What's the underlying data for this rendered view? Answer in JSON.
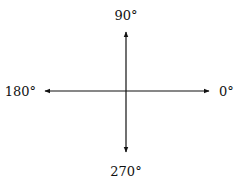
{
  "diagram": {
    "type": "angle-axes",
    "labels": {
      "right": "0°",
      "top": "90°",
      "left": "180°",
      "bottom": "270°"
    },
    "line_color": "#111111",
    "background": "#ffffff"
  }
}
